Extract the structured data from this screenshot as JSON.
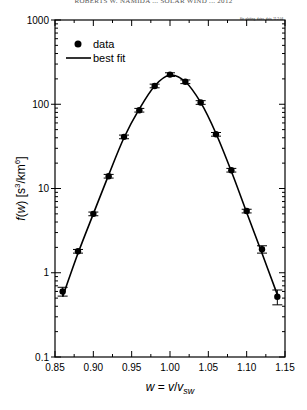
{
  "header": {
    "running_title": "ROBERTS W. NAMIDA ... SOLAR WIND ... 2012"
  },
  "stamp": "file: plotting, dates, data, 11.2.04",
  "chart_data": {
    "type": "scatter",
    "title": "",
    "xlabel": "w = v/v_sw",
    "ylabel": "f(w) [s^3/km^6]",
    "xlim": [
      0.85,
      1.15
    ],
    "ylim": [
      0.1,
      1000
    ],
    "yscale": "log",
    "grid": false,
    "legend_position": "upper left",
    "x_ticks": [
      "0.85",
      "0.90",
      "0.95",
      "1.00",
      "1.05",
      "1.10",
      "1.15"
    ],
    "y_ticks": [
      "0.1",
      "1",
      "10",
      "100",
      "1000"
    ],
    "legend": [
      {
        "label": "data",
        "marker": "filled-circle"
      },
      {
        "label": "best fit",
        "marker": "line"
      }
    ],
    "series": [
      {
        "name": "data",
        "x": [
          0.86,
          0.88,
          0.9,
          0.92,
          0.94,
          0.96,
          0.98,
          1.0,
          1.02,
          1.04,
          1.06,
          1.08,
          1.1,
          1.12,
          1.14
        ],
        "y": [
          0.6,
          1.8,
          5.0,
          14,
          41,
          85,
          165,
          225,
          185,
          105,
          44,
          16.5,
          5.4,
          1.9,
          0.52
        ],
        "yerr_rel": [
          0.12,
          0.05,
          0.05,
          0.05,
          0.05,
          0.05,
          0.05,
          0.05,
          0.05,
          0.05,
          0.05,
          0.05,
          0.05,
          0.1,
          0.2
        ]
      },
      {
        "name": "best fit",
        "type": "line",
        "x": [
          0.86,
          0.88,
          0.9,
          0.92,
          0.94,
          0.96,
          0.98,
          1.0,
          1.02,
          1.04,
          1.06,
          1.08,
          1.1,
          1.12,
          1.14
        ],
        "y": [
          0.52,
          1.7,
          5.0,
          14.5,
          40,
          88,
          165,
          222,
          185,
          105,
          45,
          16,
          5.2,
          1.7,
          0.55
        ]
      }
    ]
  },
  "ui": {
    "legend_data_label": "data",
    "legend_fit_label": "best fit"
  }
}
